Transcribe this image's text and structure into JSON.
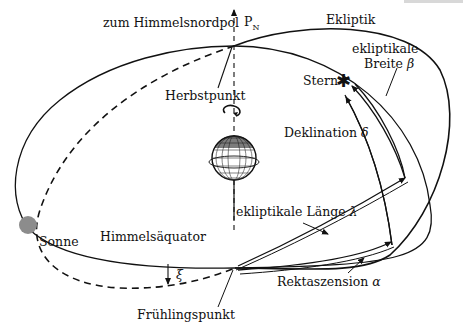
{
  "diagram": {
    "type": "celestial-coordinate-systems",
    "labels": {
      "north_pole": "zum Himmelsnordpol",
      "pn": "P",
      "pn_sub": "N",
      "ecliptic": "Ekliptik",
      "ecliptic_latitude_line1": "ekliptikale",
      "ecliptic_latitude_line2": "Breite",
      "beta": "β",
      "star": "Stern",
      "autumn_point": "Herbstpunkt",
      "declination": "Deklination",
      "delta": "δ",
      "ecliptic_longitude": "ekliptikale Länge",
      "lambda": "λ",
      "sun": "Sonne",
      "celestial_equator": "Himmelsäquator",
      "xi": "ξ",
      "vernal_point": "Frühlingspunkt",
      "right_ascension": "Rektaszension",
      "alpha": "α"
    },
    "colors": {
      "line": "#111111",
      "sun": "#8c8c8c",
      "globe": "#222222"
    }
  }
}
